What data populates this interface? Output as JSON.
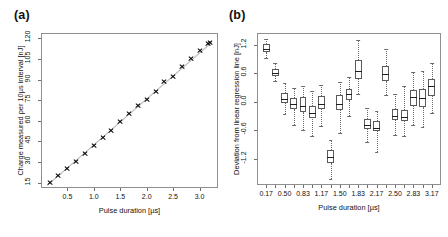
{
  "figure": {
    "panels": [
      {
        "id": "a",
        "label": "(a)",
        "xlabel": "Pulse duration [µs]",
        "ylabel": "Charge measured per 10µs interval [nJ]"
      },
      {
        "id": "b",
        "label": "(b)",
        "xlabel": "Pulse duration [µs]",
        "ylabel": "Deviation from linear regression line [nJ]"
      }
    ]
  },
  "chart_data": [
    {
      "type": "scatter",
      "panel": "(a)",
      "title": "",
      "xlabel": "Pulse duration [µs]",
      "ylabel": "Charge measured per 10µs interval [nJ]",
      "xlim": [
        0.0,
        3.35
      ],
      "ylim": [
        11.0,
        124.0
      ],
      "xticks": [
        0.5,
        1.0,
        1.5,
        2.0,
        2.5,
        3.0
      ],
      "xticklabels": [
        "0.5",
        "1.0",
        "1.5",
        "2.0",
        "2.5",
        "3.0"
      ],
      "yticks": [
        15,
        30,
        45,
        60,
        75,
        90,
        105,
        120
      ],
      "yticklabels": [
        "15",
        "30",
        "45",
        "60",
        "75",
        "90",
        "105",
        "120"
      ],
      "grid": false,
      "legend": null,
      "marker": "x",
      "x": [
        0.17,
        0.33,
        0.5,
        0.67,
        0.83,
        1.0,
        1.17,
        1.33,
        1.5,
        1.67,
        1.83,
        2.0,
        2.17,
        2.33,
        2.5,
        2.67,
        2.83,
        3.0,
        3.17,
        3.2
      ],
      "y": [
        14.8,
        20.0,
        25.2,
        30.6,
        36.3,
        42.2,
        47.8,
        53.2,
        59.6,
        65.5,
        71.2,
        75.6,
        81.0,
        88.3,
        92.3,
        99.6,
        105.3,
        111.0,
        116.3,
        117.0
      ],
      "fit_line": {
        "label": "linear regression line",
        "x": [
          0.12,
          3.24
        ],
        "y": [
          13.0,
          117.5
        ],
        "color": "#b5b5b5"
      }
    },
    {
      "type": "box",
      "panel": "(b)",
      "title": "",
      "xlabel": "Pulse duration [µs]",
      "ylabel": "Deviation from linear regression line [nJ]",
      "ylim": [
        -1.75,
        1.45
      ],
      "yticks": [
        1.2,
        0.6,
        0.0,
        -0.6,
        -1.2
      ],
      "yticklabels": [
        "1.2",
        "0.6",
        "0.0",
        "-0.6",
        "-1.2"
      ],
      "xticklabels": [
        "0.17",
        "0.50",
        "0.83",
        "1.17",
        "1.50",
        "1.83",
        "2.17",
        "2.50",
        "2.83",
        "3.17"
      ],
      "grid": false,
      "legend": null,
      "categories": [
        "0.17",
        "0.33",
        "0.50",
        "0.67",
        "0.83",
        "1.00",
        "1.17",
        "1.33",
        "1.50",
        "1.67",
        "1.83",
        "2.00",
        "2.17",
        "2.33",
        "2.50",
        "2.67",
        "2.83",
        "3.00",
        "3.17"
      ],
      "boxes": [
        {
          "category": "0.17",
          "whisker_low": 0.93,
          "q1": 1.04,
          "median": 1.12,
          "q3": 1.22,
          "whisker_high": 1.33
        },
        {
          "category": "0.33",
          "whisker_low": 0.44,
          "q1": 0.54,
          "median": 0.6,
          "q3": 0.69,
          "whisker_high": 0.82
        },
        {
          "category": "0.50",
          "whisker_low": -0.26,
          "q1": -0.02,
          "median": 0.07,
          "q3": 0.18,
          "whisker_high": 0.39
        },
        {
          "category": "0.67",
          "whisker_low": -0.49,
          "q1": -0.16,
          "median": -0.05,
          "q3": 0.08,
          "whisker_high": 0.3
        },
        {
          "category": "0.83",
          "whisker_low": -0.6,
          "q1": -0.22,
          "median": -0.09,
          "q3": 0.1,
          "whisker_high": 0.33
        },
        {
          "category": "1.00",
          "whisker_low": -0.71,
          "q1": -0.35,
          "median": -0.24,
          "q3": -0.09,
          "whisker_high": 0.23
        },
        {
          "category": "1.17",
          "whisker_low": -0.51,
          "q1": -0.16,
          "median": -0.05,
          "q3": 0.12,
          "whisker_high": 0.35
        },
        {
          "category": "1.33",
          "whisker_low": -1.62,
          "q1": -1.28,
          "median": -1.15,
          "q3": -1.01,
          "whisker_high": -0.8
        },
        {
          "category": "1.50",
          "whisker_low": -0.66,
          "q1": -0.17,
          "median": -0.04,
          "q3": 0.14,
          "whisker_high": 0.41
        },
        {
          "category": "1.67",
          "whisker_low": -0.3,
          "q1": 0.03,
          "median": 0.16,
          "q3": 0.28,
          "whisker_high": 0.52
        },
        {
          "category": "1.83",
          "whisker_low": 0.17,
          "q1": 0.49,
          "median": 0.66,
          "q3": 0.88,
          "whisker_high": 1.3
        },
        {
          "category": "2.00",
          "whisker_low": -0.84,
          "q1": -0.58,
          "median": -0.48,
          "q3": -0.36,
          "whisker_high": -0.13
        },
        {
          "category": "2.17",
          "whisker_low": -1.05,
          "q1": -0.62,
          "median": -0.54,
          "q3": -0.4,
          "whisker_high": -0.19
        },
        {
          "category": "2.33",
          "whisker_low": 0.14,
          "q1": 0.44,
          "median": 0.58,
          "q3": 0.76,
          "whisker_high": 1.12
        },
        {
          "category": "2.50",
          "whisker_low": -0.7,
          "q1": -0.39,
          "median": -0.29,
          "q3": -0.15,
          "whisker_high": 0.17
        },
        {
          "category": "2.67",
          "whisker_low": -0.72,
          "q1": -0.41,
          "median": -0.32,
          "q3": -0.17,
          "whisker_high": 0.34
        },
        {
          "category": "2.83",
          "whisker_low": -0.48,
          "q1": -0.08,
          "median": 0.1,
          "q3": 0.24,
          "whisker_high": 0.63
        },
        {
          "category": "3.00",
          "whisker_low": -0.52,
          "q1": -0.1,
          "median": 0.09,
          "q3": 0.28,
          "whisker_high": 0.66
        },
        {
          "category": "3.17",
          "whisker_low": -0.24,
          "q1": 0.12,
          "median": 0.34,
          "q3": 0.48,
          "whisker_high": 0.82
        }
      ]
    }
  ]
}
